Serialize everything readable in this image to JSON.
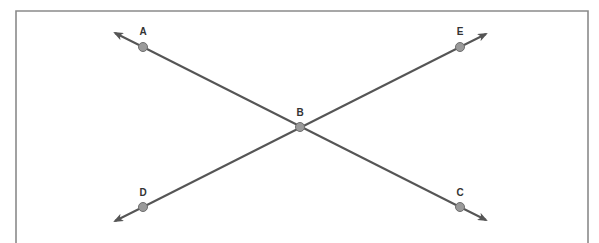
{
  "diagram": {
    "type": "intersecting-lines",
    "colors": {
      "frame": "#8a8a8a",
      "line": "#555555",
      "point_fill": "#9a9a9a",
      "label": "#333333"
    },
    "points": [
      {
        "label": "A",
        "x": 143,
        "y": 47
      },
      {
        "label": "B",
        "x": 300,
        "y": 127
      },
      {
        "label": "C",
        "x": 460,
        "y": 207
      },
      {
        "label": "D",
        "x": 143,
        "y": 207
      },
      {
        "label": "E",
        "x": 460,
        "y": 47
      }
    ],
    "lines": [
      {
        "name": "line-AC",
        "through": [
          "A",
          "B",
          "C"
        ],
        "arrows": "both"
      },
      {
        "name": "line-DE",
        "through": [
          "D",
          "B",
          "E"
        ],
        "arrows": "both"
      }
    ]
  }
}
